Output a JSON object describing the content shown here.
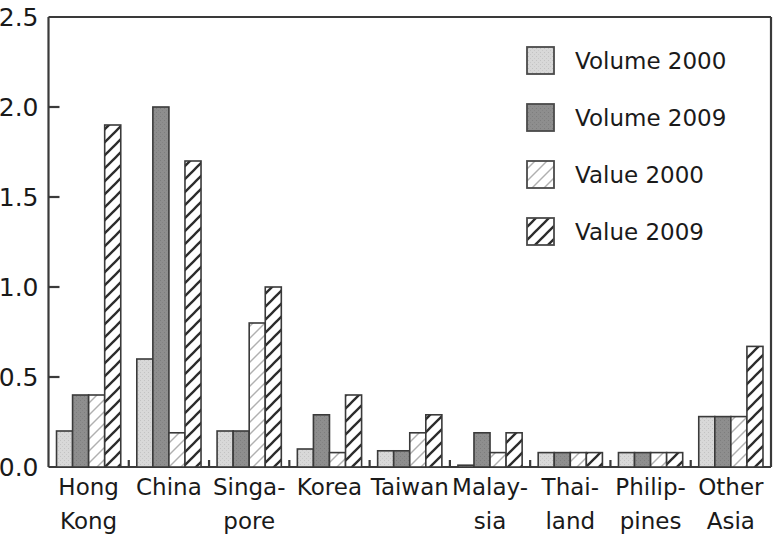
{
  "chart_data": {
    "type": "bar",
    "title": "",
    "subtitle": "",
    "xlabel": "",
    "ylabel": "",
    "ylim": [
      0.0,
      2.5
    ],
    "yticks": [
      0.0,
      0.5,
      1.0,
      1.5,
      2.0,
      2.5
    ],
    "ytick_labels": [
      "0.0",
      "0.5",
      "1.0",
      "1.5",
      "2.0",
      "2.5"
    ],
    "grid": false,
    "legend_position": "top-right",
    "categories": [
      "Hong Kong",
      "China",
      "Singapore",
      "Korea",
      "Taiwan",
      "Malaysia",
      "Thailand",
      "Philippines",
      "Other Asia"
    ],
    "category_lines": [
      [
        "Hong",
        "Kong"
      ],
      [
        "China",
        ""
      ],
      [
        "Singa-",
        "pore"
      ],
      [
        "Korea",
        ""
      ],
      [
        "Taiwan",
        ""
      ],
      [
        "Malay-",
        "sia"
      ],
      [
        "Thai-",
        "land"
      ],
      [
        "Philip-",
        "pines"
      ],
      [
        "Other",
        "Asia"
      ]
    ],
    "series": [
      {
        "name": "Volume 2000",
        "fill": "#d4d4d4",
        "pattern": "solid-light",
        "values": [
          0.2,
          0.6,
          0.2,
          0.1,
          0.09,
          0.01,
          0.08,
          0.08,
          0.28
        ]
      },
      {
        "name": "Volume 2009",
        "fill": "#8c8c8c",
        "pattern": "solid-dark",
        "values": [
          0.4,
          2.0,
          0.2,
          0.29,
          0.09,
          0.19,
          0.08,
          0.08,
          0.28
        ]
      },
      {
        "name": "Value 2000",
        "fill": "#ffffff",
        "pattern": "hatch-light",
        "values": [
          0.4,
          0.19,
          0.8,
          0.08,
          0.19,
          0.08,
          0.08,
          0.08,
          0.28
        ]
      },
      {
        "name": "Value 2009",
        "fill": "#ffffff",
        "pattern": "hatch-dark",
        "values": [
          1.9,
          1.7,
          1.0,
          0.4,
          0.29,
          0.19,
          0.08,
          0.08,
          0.67
        ]
      }
    ]
  },
  "axis": {
    "line_color": "#3a3a3a"
  },
  "legend": {
    "entries": [
      {
        "label": "Volume 2000",
        "pattern": "solid-light"
      },
      {
        "label": "Volume 2009",
        "pattern": "solid-dark"
      },
      {
        "label": "Value 2000",
        "pattern": "hatch-light"
      },
      {
        "label": "Value 2009",
        "pattern": "hatch-dark"
      }
    ]
  }
}
